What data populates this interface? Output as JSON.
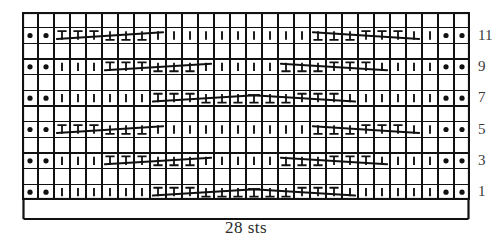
{
  "chart_data": {
    "type": "table",
    "title": "",
    "caption": "28 sts",
    "stitch_count": 28,
    "row_count": 12,
    "grid": {
      "columns": 28,
      "rows": 12,
      "cell_width": 16,
      "cell_height": 15.67,
      "grid_on": true,
      "line_color": "#111111",
      "cell_fill": "#ffffff"
    },
    "xlabel": "28 sts",
    "ylabel": "",
    "row_labels": [
      "11",
      "9",
      "7",
      "5",
      "3",
      "1"
    ],
    "row_label_position": "right",
    "row_label_rows": [
      1,
      3,
      5,
      7,
      9,
      11
    ],
    "legend": [],
    "symbol_names": {
      "purl": "purl-dot",
      "knit": "knit-bar",
      "twist_right": "right-twist-T",
      "twist_left": "left-twist-inverted-T",
      "travel": "travel-diagonal-line"
    },
    "symbols": {
      "purl": "●",
      "knit": "│",
      "twist_right": "T",
      "twist_left": "⊥"
    },
    "rows": [
      {
        "row": 12,
        "label": "",
        "blank": true,
        "cells": []
      },
      {
        "row": 11,
        "label": "11",
        "blank": false,
        "cells": [
          "purl",
          "purl",
          "twist_right",
          "twist_right",
          "twist_right",
          "twist_left",
          "twist_left",
          "twist_left",
          "knit",
          "knit",
          "knit",
          "knit",
          "knit",
          "knit",
          "knit",
          "knit",
          "knit",
          "knit",
          "twist_left",
          "twist_left",
          "twist_left",
          "twist_right",
          "twist_right",
          "twist_right",
          "knit",
          "knit",
          "purl",
          "purl"
        ],
        "travel_lines": [
          {
            "from_col": 2,
            "to_col": 8,
            "from_y": 0.72,
            "to_y": 0.3
          },
          {
            "from_col": 18,
            "to_col": 24,
            "from_y": 0.3,
            "to_y": 0.72
          }
        ]
      },
      {
        "row": 10,
        "label": "",
        "blank": true,
        "cells": []
      },
      {
        "row": 9,
        "label": "9",
        "blank": false,
        "cells": [
          "purl",
          "purl",
          "knit",
          "knit",
          "knit",
          "twist_right",
          "twist_right",
          "twist_right",
          "twist_left",
          "twist_left",
          "twist_left",
          "knit",
          "knit",
          "knit",
          "knit",
          "knit",
          "twist_left",
          "twist_left",
          "twist_left",
          "twist_right",
          "twist_right",
          "twist_right",
          "knit",
          "knit",
          "knit",
          "knit",
          "purl",
          "purl"
        ],
        "travel_lines": [
          {
            "from_col": 5,
            "to_col": 11,
            "from_y": 0.72,
            "to_y": 0.3
          },
          {
            "from_col": 16,
            "to_col": 22,
            "from_y": 0.3,
            "to_y": 0.72
          }
        ]
      },
      {
        "row": 8,
        "label": "",
        "blank": true,
        "cells": []
      },
      {
        "row": 7,
        "label": "7",
        "blank": false,
        "cells": [
          "purl",
          "purl",
          "knit",
          "knit",
          "knit",
          "knit",
          "knit",
          "knit",
          "twist_right",
          "twist_right",
          "twist_right",
          "twist_left",
          "twist_left",
          "twist_left",
          "twist_left",
          "twist_left",
          "twist_left",
          "twist_right",
          "twist_right",
          "twist_right",
          "knit",
          "knit",
          "knit",
          "knit",
          "knit",
          "knit",
          "purl",
          "purl"
        ],
        "travel_lines": [
          {
            "from_col": 8,
            "to_col": 14,
            "from_y": 0.72,
            "to_y": 0.3
          },
          {
            "from_col": 14,
            "to_col": 20,
            "from_y": 0.3,
            "to_y": 0.72
          }
        ]
      },
      {
        "row": 6,
        "label": "",
        "blank": true,
        "cells": []
      },
      {
        "row": 5,
        "label": "5",
        "blank": false,
        "cells": [
          "purl",
          "purl",
          "twist_right",
          "twist_right",
          "twist_right",
          "twist_left",
          "twist_left",
          "twist_left",
          "knit",
          "knit",
          "knit",
          "knit",
          "knit",
          "knit",
          "knit",
          "knit",
          "knit",
          "knit",
          "twist_left",
          "twist_left",
          "twist_left",
          "twist_right",
          "twist_right",
          "twist_right",
          "knit",
          "knit",
          "purl",
          "purl"
        ],
        "travel_lines": [
          {
            "from_col": 2,
            "to_col": 8,
            "from_y": 0.72,
            "to_y": 0.3
          },
          {
            "from_col": 18,
            "to_col": 24,
            "from_y": 0.3,
            "to_y": 0.72
          }
        ]
      },
      {
        "row": 4,
        "label": "",
        "blank": true,
        "cells": []
      },
      {
        "row": 3,
        "label": "3",
        "blank": false,
        "cells": [
          "purl",
          "purl",
          "knit",
          "knit",
          "knit",
          "twist_right",
          "twist_right",
          "twist_right",
          "twist_left",
          "twist_left",
          "twist_left",
          "knit",
          "knit",
          "knit",
          "knit",
          "knit",
          "twist_left",
          "twist_left",
          "twist_left",
          "twist_right",
          "twist_right",
          "twist_right",
          "knit",
          "knit",
          "knit",
          "knit",
          "purl",
          "purl"
        ],
        "travel_lines": [
          {
            "from_col": 5,
            "to_col": 11,
            "from_y": 0.72,
            "to_y": 0.3
          },
          {
            "from_col": 16,
            "to_col": 22,
            "from_y": 0.3,
            "to_y": 0.72
          }
        ]
      },
      {
        "row": 2,
        "label": "",
        "blank": true,
        "cells": []
      },
      {
        "row": 1,
        "label": "1",
        "blank": false,
        "cells": [
          "purl",
          "purl",
          "knit",
          "knit",
          "knit",
          "knit",
          "knit",
          "knit",
          "twist_right",
          "twist_right",
          "twist_right",
          "twist_left",
          "twist_left",
          "twist_left",
          "twist_left",
          "twist_left",
          "twist_left",
          "twist_right",
          "twist_right",
          "twist_right",
          "knit",
          "knit",
          "knit",
          "knit",
          "knit",
          "knit",
          "purl",
          "purl"
        ],
        "travel_lines": [
          {
            "from_col": 8,
            "to_col": 14,
            "from_y": 0.72,
            "to_y": 0.3
          },
          {
            "from_col": 14,
            "to_col": 20,
            "from_y": 0.3,
            "to_y": 0.72
          }
        ]
      }
    ]
  }
}
